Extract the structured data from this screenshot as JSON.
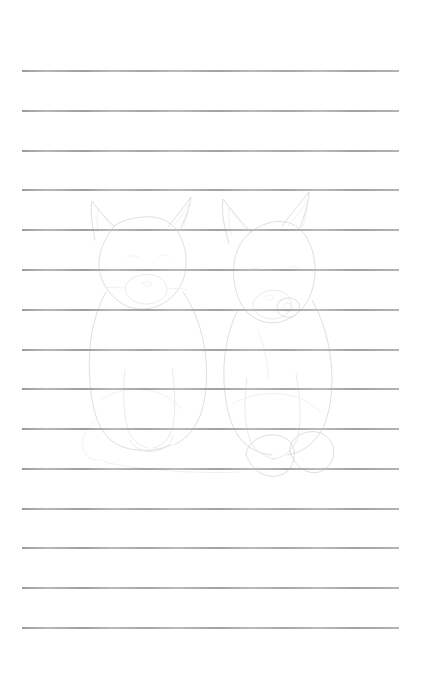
{
  "page": {
    "width": 421,
    "height": 674,
    "background_color": "#ffffff",
    "text_content": "",
    "handwriting_present": false
  },
  "ruled_lines": {
    "name": "ruled-guide-lines",
    "count": 15,
    "color": "#b9b9bd",
    "ink_dark_color": "#78787e",
    "thickness_px": 2,
    "left_x": 22,
    "right_x": 399,
    "first_line_y": 71,
    "spacing_px": 39.8,
    "y_positions": [
      71,
      111,
      151,
      190,
      230,
      270,
      310,
      350,
      389,
      429,
      469,
      509,
      548,
      588,
      628
    ]
  },
  "sketch": {
    "name": "faint-pencil-sketch",
    "description": "Two cat-like animals sitting side by side",
    "stroke_color": "#d9d9dd",
    "soft_stroke_color": "#e3e3e7",
    "faint_stroke_color": "#e9e9ec",
    "subjects": [
      {
        "label": "left-cat",
        "features": [
          "pointed-ear-left",
          "pointed-ear-right",
          "head-outline",
          "muzzle",
          "body",
          "front-leg",
          "paw",
          "tail-curve"
        ]
      },
      {
        "label": "right-cat",
        "features": [
          "pointed-ear-left",
          "pointed-ear-right",
          "head-outline",
          "eye",
          "muzzle",
          "body",
          "front-leg",
          "paw",
          "paw"
        ]
      }
    ]
  },
  "margins": {
    "top_blank_px": 71,
    "bottom_blank_px": 46,
    "left_blank_px": 22,
    "right_blank_px": 22
  }
}
